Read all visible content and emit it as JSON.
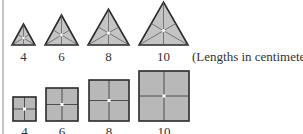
{
  "figure": {
    "caption": "(Lengths in centimeters)",
    "colors": {
      "fill": "#bdbdbd",
      "stroke": "#2a2a2a",
      "center_dot": "#ffffff",
      "left_rule": "#8a8a8a"
    },
    "triangles": [
      {
        "label": "4",
        "side": 4
      },
      {
        "label": "6",
        "side": 6
      },
      {
        "label": "8",
        "side": 8
      },
      {
        "label": "10",
        "side": 10
      }
    ],
    "squares": [
      {
        "label": "4",
        "side": 4
      },
      {
        "label": "6",
        "side": 6
      },
      {
        "label": "8",
        "side": 8
      },
      {
        "label": "10",
        "side": 10
      }
    ]
  }
}
